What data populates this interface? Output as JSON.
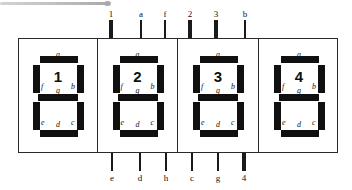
{
  "diagram": {
    "package": {
      "outline_color": "#2a2a2a",
      "background": "#ffffff"
    },
    "segment_color": "#101010",
    "pin_color": "#1a1a1a",
    "segment_labels": {
      "a": "a",
      "b": "b",
      "c": "c",
      "d": "d",
      "e": "e",
      "f": "f",
      "g": "g"
    },
    "digits": [
      {
        "value": "1",
        "x": 18,
        "width": 79
      },
      {
        "value": "2",
        "x": 97,
        "width": 80
      },
      {
        "value": "3",
        "x": 177,
        "width": 81
      },
      {
        "value": "4",
        "x": 258,
        "width": 80
      }
    ],
    "top_pins": [
      {
        "label": "1",
        "x": 111,
        "weight": "thick"
      },
      {
        "label": "a",
        "x": 141,
        "weight": "thin"
      },
      {
        "label": "f",
        "x": 165,
        "weight": "thin"
      },
      {
        "label": "2",
        "x": 190,
        "weight": "thick"
      },
      {
        "label": "3",
        "x": 216,
        "weight": "thick"
      },
      {
        "label": "b",
        "x": 245,
        "weight": "thin"
      }
    ],
    "bottom_pins": [
      {
        "label": "e",
        "x": 112,
        "weight": "thin"
      },
      {
        "label": "d",
        "x": 140,
        "weight": "thin"
      },
      {
        "label": "h",
        "x": 166,
        "weight": "thin"
      },
      {
        "label": "c",
        "x": 192,
        "weight": "thin"
      },
      {
        "label": "g",
        "x": 218,
        "weight": "thin"
      },
      {
        "label": "4",
        "x": 244,
        "weight": "thick"
      }
    ],
    "artifact": {
      "present": true,
      "color": "#a9a9ae"
    }
  }
}
